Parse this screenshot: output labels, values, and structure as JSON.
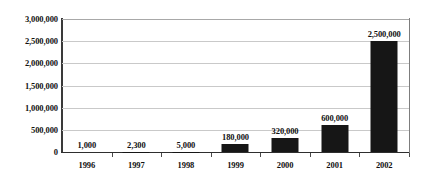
{
  "chart_data": {
    "type": "bar",
    "title": "",
    "subtitle": "",
    "xlabel": "",
    "ylabel": "",
    "categories": [
      "1996",
      "1997",
      "1998",
      "1999",
      "2000",
      "2001",
      "2002"
    ],
    "values": [
      1000,
      2300,
      5000,
      180000,
      320000,
      600000,
      2500000
    ],
    "value_labels": [
      "1,000",
      "2,300",
      "5,000",
      "180,000",
      "320,000",
      "600,000",
      "2,500,000"
    ],
    "ylim": [
      0,
      3000000
    ],
    "ytick_labels": [
      "3,000,000",
      "2,500,000",
      "2,000,000",
      "1,500,000",
      "1,000,000",
      "500,000",
      "0"
    ],
    "ytick_values": [
      3000000,
      2500000,
      2000000,
      1500000,
      1000000,
      500000,
      0
    ],
    "grid": true,
    "legend": false,
    "legend_position": "none",
    "bar_color": "#161616",
    "gridline_color": "#c9c9c9",
    "axis_color": "#2e2e2e",
    "background_color": "#ffffff"
  }
}
